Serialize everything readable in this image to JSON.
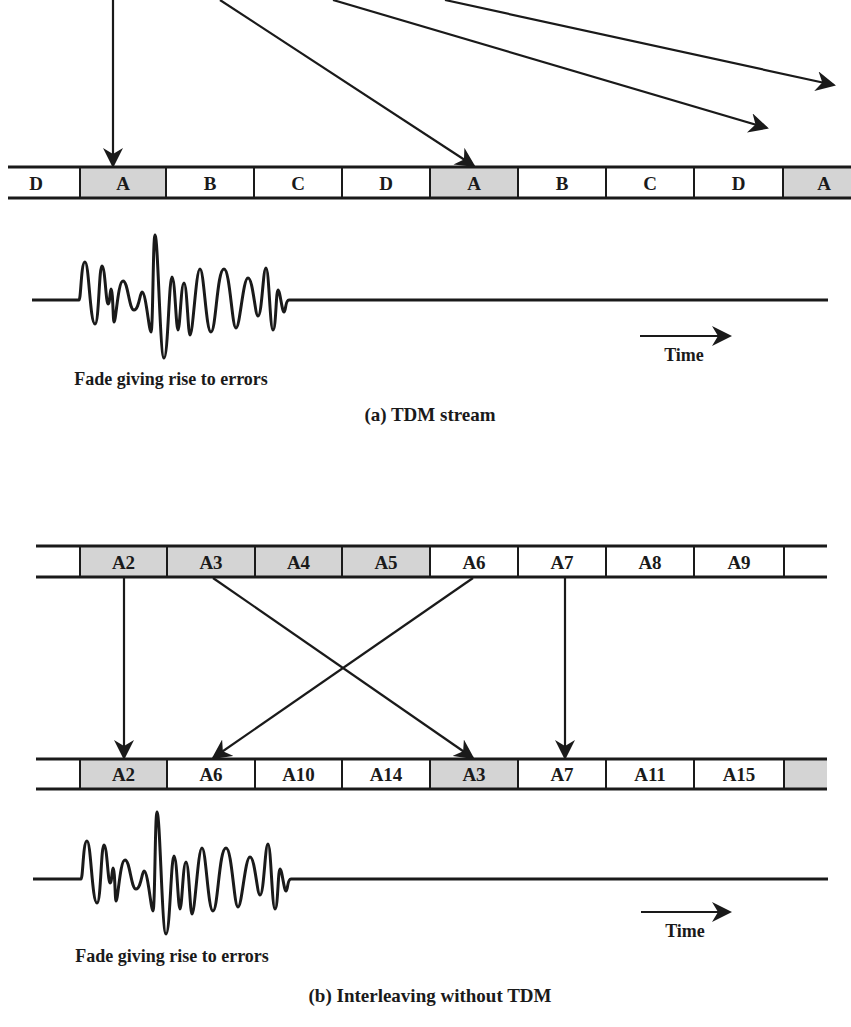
{
  "colors": {
    "ink": "#1a1a1a",
    "shaded": "#d4d4d4",
    "background": "#ffffff"
  },
  "panel_a": {
    "caption": "(a) TDM stream",
    "stream": {
      "cells": [
        {
          "label": "D",
          "shaded": false
        },
        {
          "label": "A",
          "shaded": true
        },
        {
          "label": "B",
          "shaded": false
        },
        {
          "label": "C",
          "shaded": false
        },
        {
          "label": "D",
          "shaded": false
        },
        {
          "label": "A",
          "shaded": true
        },
        {
          "label": "B",
          "shaded": false
        },
        {
          "label": "C",
          "shaded": false
        },
        {
          "label": "D",
          "shaded": false
        },
        {
          "label": "A",
          "shaded": true
        }
      ]
    },
    "fade_label": "Fade giving rise to errors",
    "time_label": "Time"
  },
  "panel_b": {
    "caption": "(b) Interleaving without TDM",
    "input_stream": {
      "cells": [
        {
          "label": "A2",
          "shaded": true
        },
        {
          "label": "A3",
          "shaded": true
        },
        {
          "label": "A4",
          "shaded": true
        },
        {
          "label": "A5",
          "shaded": true
        },
        {
          "label": "A6",
          "shaded": false
        },
        {
          "label": "A7",
          "shaded": false
        },
        {
          "label": "A8",
          "shaded": false
        },
        {
          "label": "A9",
          "shaded": false
        },
        {
          "label": "",
          "shaded": false
        }
      ]
    },
    "output_stream": {
      "cells": [
        {
          "label": "A2",
          "shaded": true
        },
        {
          "label": "A6",
          "shaded": false
        },
        {
          "label": "A10",
          "shaded": false
        },
        {
          "label": "A14",
          "shaded": false
        },
        {
          "label": "A3",
          "shaded": true
        },
        {
          "label": "A7",
          "shaded": false
        },
        {
          "label": "A11",
          "shaded": false
        },
        {
          "label": "A15",
          "shaded": false
        },
        {
          "label": "",
          "shaded": true
        }
      ]
    },
    "mappings": [
      {
        "from": "A2",
        "to": "A2"
      },
      {
        "from": "A3",
        "to": "A3"
      },
      {
        "from": "A6",
        "to": "A6"
      },
      {
        "from": "A7",
        "to": "A7"
      }
    ],
    "fade_label": "Fade giving rise to errors",
    "time_label": "Time"
  }
}
